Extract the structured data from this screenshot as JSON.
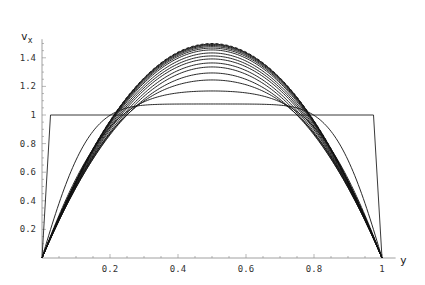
{
  "chart_data": {
    "type": "line",
    "title": "",
    "xlabel": "y",
    "ylabel": "v_x",
    "xlim": [
      0,
      1.0
    ],
    "ylim": [
      0,
      1.55
    ],
    "grid": false,
    "legend": null,
    "x_ticks": [
      {
        "value": 0.2,
        "label": "0.2"
      },
      {
        "value": 0.4,
        "label": "0.4"
      },
      {
        "value": 0.6,
        "label": "0.6"
      },
      {
        "value": 0.8,
        "label": "0.8"
      },
      {
        "value": 1.0,
        "label": "1"
      }
    ],
    "y_ticks": [
      {
        "value": 0.2,
        "label": "0.2"
      },
      {
        "value": 0.4,
        "label": "0.4"
      },
      {
        "value": 0.6,
        "label": "0.6"
      },
      {
        "value": 0.8,
        "label": "0.8"
      },
      {
        "value": 1.0,
        "label": "1"
      },
      {
        "value": 1.2,
        "label": "1.2"
      },
      {
        "value": 1.4,
        "label": "1.4"
      }
    ],
    "initial_profile": {
      "ramp_width": 0.025,
      "plateau": 1.0
    },
    "steady_profile": {
      "formula": "6*y*(1-y)",
      "peak": 1.5,
      "style": "dashed"
    },
    "profile_center_values": [
      1.077,
      1.168,
      1.245,
      1.294,
      1.336,
      1.364,
      1.392,
      1.413,
      1.434,
      1.455,
      1.468,
      1.478,
      1.486,
      1.492,
      1.496
    ],
    "crossing_points": [
      {
        "y": 0.27,
        "v_x": 1.22
      },
      {
        "y": 0.73,
        "v_x": 1.22
      }
    ]
  },
  "axes": {
    "x_label": "y",
    "y_label_main": "v",
    "y_label_sub": "x"
  }
}
